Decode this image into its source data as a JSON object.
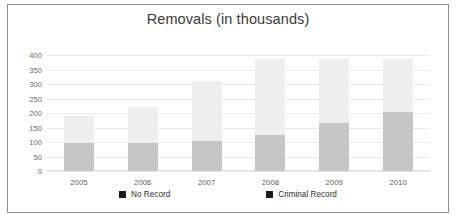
{
  "chart_data": {
    "type": "bar",
    "subtype": "stacked-vertical",
    "title": "Removals (in thousands)",
    "xlabel": "",
    "ylabel": "",
    "categories": [
      "2005",
      "2006",
      "2007",
      "2008",
      "2009",
      "2010"
    ],
    "series": [
      {
        "name": "No Record",
        "color": "#c6c6c6",
        "values": [
          95,
          98,
          105,
          125,
          165,
          205
        ]
      },
      {
        "name": "Criminal Record",
        "color": "#eeeeee",
        "values": [
          95,
          122,
          205,
          260,
          220,
          180
        ]
      }
    ],
    "totals": [
      190,
      220,
      310,
      385,
      385,
      385
    ],
    "ylim": [
      0,
      400
    ],
    "yticks": [
      0,
      50,
      100,
      150,
      200,
      250,
      300,
      350,
      400
    ],
    "ytick_labels": [
      "0",
      "50",
      "100",
      "150",
      "200",
      "250",
      "300",
      "350",
      "400"
    ],
    "grid": true,
    "legend_position": "bottom",
    "legend": [
      "No Record",
      "Criminal Record"
    ]
  },
  "legend_items": [
    {
      "label": "No Record",
      "swatch_name": "legend-swatch-no-record"
    },
    {
      "label": "Criminal Record",
      "swatch_name": "legend-swatch-criminal-record"
    }
  ]
}
